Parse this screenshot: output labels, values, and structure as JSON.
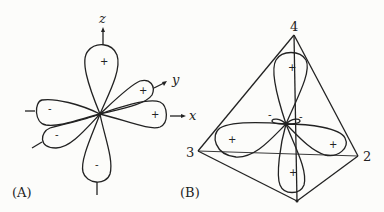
{
  "panels": {
    "a": {
      "label": "(A)",
      "axes": {
        "z": "z",
        "y": "y",
        "x": "x"
      },
      "lobes": [
        {
          "id": "z-positive",
          "sign": "+"
        },
        {
          "id": "z-negative",
          "sign": "-"
        },
        {
          "id": "x-positive",
          "sign": "+"
        },
        {
          "id": "x-negative",
          "sign": "-"
        },
        {
          "id": "y-positive",
          "sign": "+"
        },
        {
          "id": "y-negative",
          "sign": "-"
        }
      ]
    },
    "b": {
      "label": "(B)",
      "vertices": {
        "v2": "2",
        "v3": "3",
        "v4": "4"
      },
      "lobes": [
        {
          "id": "up",
          "sign": "+"
        },
        {
          "id": "down",
          "sign": "+"
        },
        {
          "id": "left",
          "sign": "+"
        },
        {
          "id": "right",
          "sign": "+"
        },
        {
          "id": "small-left",
          "sign": "-"
        },
        {
          "id": "small-right",
          "sign": "-"
        }
      ]
    }
  }
}
